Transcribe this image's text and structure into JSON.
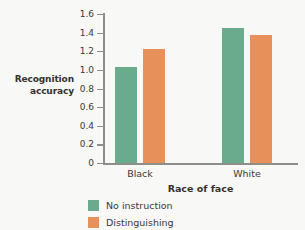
{
  "chart_data": {
    "type": "bar",
    "title": "",
    "xlabel": "Race of face",
    "ylabel": "Recognition accuracy",
    "categories": [
      "Black",
      "White"
    ],
    "series": [
      {
        "name": "No instruction",
        "color": "#6aab8e",
        "values": [
          1.03,
          1.45
        ]
      },
      {
        "name": "Distinguishing",
        "color": "#e8905a",
        "values": [
          1.22,
          1.37
        ]
      }
    ],
    "ylim": [
      0,
      1.6
    ],
    "ytick_step": 0.2,
    "ytick_labels": [
      "1.6",
      "1.4",
      "1.2",
      "1.0",
      "0.8",
      "0.6",
      "0.4",
      "0.2",
      "0"
    ],
    "ytick_values": [
      1.6,
      1.4,
      1.2,
      1.0,
      0.8,
      0.6,
      0.4,
      0.2,
      0
    ],
    "grid": false,
    "legend_position": "bottom-left"
  },
  "axes": {
    "y_title_line1": "Recognition",
    "y_title_line2": "accuracy",
    "x_title": "Race of face"
  },
  "legend": {
    "items": [
      {
        "label": "No instruction",
        "color": "#6aab8e"
      },
      {
        "label": "Distinguishing",
        "color": "#e8905a"
      }
    ]
  },
  "colors": {
    "series_green": "#6aab8e",
    "series_orange": "#e8905a",
    "axis": "#8d8d8a",
    "text": "#3b3a37",
    "background": "#f8f8f6"
  }
}
